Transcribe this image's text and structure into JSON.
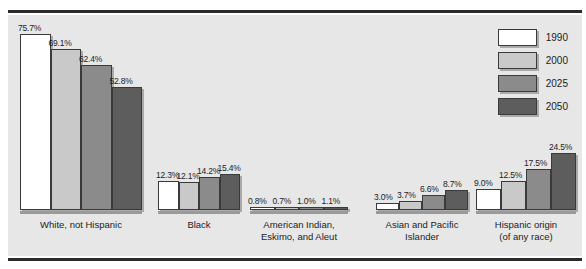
{
  "chart_data": {
    "type": "bar",
    "title": "",
    "subtitle": "",
    "xlabel": "",
    "ylabel": "",
    "ylim": [
      0,
      75.7
    ],
    "grid": false,
    "legend_position": "top-right",
    "value_suffix": "%",
    "categories": [
      "White, not Hispanic",
      "Black",
      "American Indian,\nEskimo, and Aleut",
      "Asian and Pacific\nIslander",
      "Hispanic origin\n(of any race)"
    ],
    "category_lines": [
      [
        "White, not Hispanic"
      ],
      [
        "Black"
      ],
      [
        "American Indian,",
        "Eskimo, and Aleut"
      ],
      [
        "Asian and Pacific",
        "Islander"
      ],
      [
        "Hispanic origin",
        "(of any race)"
      ]
    ],
    "series": [
      {
        "name": "1990",
        "color": "#ffffff",
        "values": [
          75.7,
          12.3,
          0.8,
          3.0,
          9.0
        ],
        "labels": [
          "75.7%",
          "12.3%",
          "0.8%",
          "3.0%",
          "9.0%"
        ]
      },
      {
        "name": "2000",
        "color": "#c9c9c9",
        "values": [
          69.1,
          12.1,
          0.7,
          3.7,
          12.5
        ],
        "labels": [
          "69.1%",
          "12.1%",
          "0.7%",
          "3.7%",
          "12.5%"
        ]
      },
      {
        "name": "2025",
        "color": "#8b8b8b",
        "values": [
          62.4,
          14.2,
          1.0,
          6.6,
          17.5
        ],
        "labels": [
          "62.4%",
          "14.2%",
          "1.0%",
          "6.6%",
          "17.5%"
        ]
      },
      {
        "name": "2050",
        "color": "#5d5d5d",
        "values": [
          52.8,
          15.4,
          1.1,
          8.7,
          24.5
        ],
        "labels": [
          "52.8%",
          "15.4%",
          "1.1%",
          "8.7%",
          "24.5%"
        ]
      }
    ]
  },
  "legend": {
    "items": [
      {
        "label": "1990",
        "color": "#ffffff"
      },
      {
        "label": "2000",
        "color": "#c9c9c9"
      },
      {
        "label": "2025",
        "color": "#8b8b8b"
      },
      {
        "label": "2050",
        "color": "#5d5d5d"
      }
    ]
  },
  "style": {
    "background": "#e7e7e7",
    "page_background": "#ffffff",
    "rule_color": "#2b2b2b",
    "baseline_color": "#9a9a9a",
    "bar_outline": "#3a3a3a",
    "text_color": "#1c1c1c"
  },
  "layout": {
    "group_x": [
      12,
      150,
      242,
      368,
      468
    ],
    "group_w": [
      122,
      82,
      98,
      92,
      100
    ]
  }
}
